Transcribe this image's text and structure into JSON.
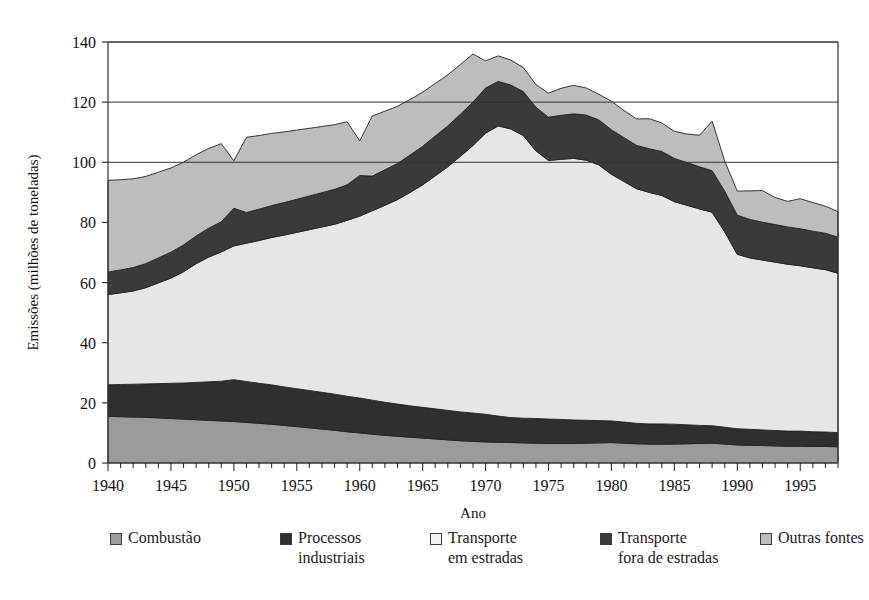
{
  "chart_data": {
    "type": "area",
    "stacked": true,
    "title": "",
    "xlabel": "Ano",
    "ylabel": "Emissões (milhões de toneladas)",
    "xlim": [
      1940,
      1998
    ],
    "ylim": [
      0,
      140
    ],
    "ytick_step": 20,
    "yticks": [
      0,
      20,
      40,
      60,
      80,
      100,
      120,
      140
    ],
    "xticks_labeled": [
      1940,
      1945,
      1950,
      1955,
      1960,
      1965,
      1970,
      1975,
      1980,
      1985,
      1990,
      1995
    ],
    "xtick_minor_step": 1,
    "grid": "horizontal-above-100-only",
    "legend_position": "bottom",
    "x": [
      1940,
      1941,
      1942,
      1943,
      1944,
      1945,
      1946,
      1947,
      1948,
      1949,
      1950,
      1951,
      1952,
      1953,
      1954,
      1955,
      1956,
      1957,
      1958,
      1959,
      1960,
      1961,
      1962,
      1963,
      1964,
      1965,
      1966,
      1967,
      1968,
      1969,
      1970,
      1971,
      1972,
      1973,
      1974,
      1975,
      1976,
      1977,
      1978,
      1979,
      1980,
      1981,
      1982,
      1983,
      1984,
      1985,
      1986,
      1987,
      1988,
      1989,
      1990,
      1991,
      1992,
      1993,
      1994,
      1995,
      1996,
      1997,
      1998
    ],
    "series": [
      {
        "name": "Combustão",
        "color": "#9b9b9b",
        "values": [
          15.5,
          15.4,
          15.3,
          15.2,
          15.0,
          14.8,
          14.6,
          14.4,
          14.2,
          14.0,
          13.8,
          13.5,
          13.2,
          12.9,
          12.5,
          12.1,
          11.7,
          11.3,
          10.9,
          10.4,
          10.0,
          9.6,
          9.2,
          8.9,
          8.6,
          8.3,
          8.0,
          7.7,
          7.4,
          7.2,
          7.0,
          6.9,
          6.8,
          6.7,
          6.6,
          6.5,
          6.5,
          6.5,
          6.6,
          6.7,
          6.8,
          6.6,
          6.4,
          6.3,
          6.3,
          6.3,
          6.4,
          6.5,
          6.6,
          6.3,
          6.0,
          5.9,
          5.8,
          5.7,
          5.6,
          5.6,
          5.5,
          5.5,
          5.4
        ]
      },
      {
        "name": "Processos industriais",
        "color": "#2f2f2f",
        "values": [
          10.5,
          10.7,
          10.9,
          11.1,
          11.4,
          11.7,
          12.0,
          12.4,
          12.8,
          13.2,
          13.9,
          13.6,
          13.3,
          13.1,
          12.8,
          12.6,
          12.4,
          12.2,
          12.0,
          11.8,
          11.6,
          11.3,
          11.0,
          10.7,
          10.4,
          10.2,
          10.0,
          9.8,
          9.6,
          9.4,
          9.2,
          8.7,
          8.3,
          8.2,
          8.2,
          8.1,
          8.0,
          7.8,
          7.6,
          7.4,
          7.2,
          7.0,
          6.8,
          6.7,
          6.7,
          6.6,
          6.3,
          6.0,
          5.8,
          5.6,
          5.4,
          5.3,
          5.2,
          5.1,
          5.0,
          5.0,
          4.9,
          4.8,
          4.7
        ]
      },
      {
        "name": "Transporte em estradas",
        "color": "#e6e6e6",
        "values": [
          30.0,
          30.5,
          31.0,
          32.0,
          33.5,
          35.0,
          37.0,
          39.5,
          41.5,
          43.0,
          44.5,
          46.0,
          47.5,
          49.0,
          50.5,
          52.0,
          53.5,
          55.0,
          56.5,
          58.5,
          60.5,
          63.0,
          65.5,
          68.0,
          71.0,
          74.0,
          77.5,
          81.0,
          85.0,
          89.0,
          93.5,
          96.5,
          96.0,
          94.0,
          89.0,
          86.0,
          86.5,
          87.0,
          86.5,
          85.0,
          82.0,
          80.0,
          78.0,
          77.0,
          76.0,
          74.0,
          73.0,
          72.0,
          71.0,
          65.0,
          58.0,
          57.0,
          56.5,
          56.0,
          55.5,
          55.0,
          54.5,
          54.0,
          53.0
        ]
      },
      {
        "name": "Transporte fora de estradas",
        "color": "#3a3a3a",
        "values": [
          7.5,
          7.6,
          7.8,
          8.0,
          8.3,
          8.6,
          8.9,
          9.2,
          9.6,
          10.0,
          12.5,
          10.2,
          10.4,
          10.6,
          10.8,
          11.0,
          11.2,
          11.4,
          11.6,
          11.8,
          13.5,
          11.5,
          11.8,
          12.0,
          12.4,
          12.8,
          13.2,
          13.6,
          14.0,
          14.4,
          15.0,
          14.8,
          14.6,
          14.6,
          14.5,
          14.4,
          14.6,
          14.8,
          15.0,
          15.0,
          14.8,
          14.6,
          14.4,
          14.5,
          14.6,
          14.4,
          14.2,
          14.0,
          13.8,
          13.5,
          13.0,
          12.8,
          12.6,
          12.5,
          12.4,
          12.3,
          12.2,
          12.1,
          12.0
        ]
      },
      {
        "name": "Outras fontes",
        "color": "#bdbdbd",
        "values": [
          30.5,
          30.0,
          29.5,
          29.0,
          28.5,
          28.0,
          27.5,
          27.0,
          26.5,
          26.0,
          15.8,
          25.0,
          24.5,
          24.0,
          23.5,
          23.0,
          22.5,
          22.0,
          21.5,
          21.0,
          11.5,
          20.0,
          19.5,
          19.0,
          18.5,
          18.0,
          17.5,
          17.0,
          16.5,
          16.0,
          9.0,
          8.5,
          8.3,
          8.0,
          7.5,
          8.0,
          9.0,
          9.5,
          9.0,
          8.5,
          9.5,
          9.0,
          8.8,
          10.0,
          9.5,
          9.0,
          9.5,
          10.5,
          16.5,
          10.0,
          8.0,
          9.5,
          10.5,
          9.0,
          8.5,
          10.0,
          9.5,
          9.0,
          8.5
        ]
      }
    ]
  },
  "legend": {
    "items": [
      {
        "label": "Combustão",
        "swatch": "#9b9b9b"
      },
      {
        "label": "Processos\nindustriais",
        "swatch": "#2f2f2f"
      },
      {
        "label": "Transporte\nem estradas",
        "swatch": "#f2f2f2"
      },
      {
        "label": "Transporte\nfora de estradas",
        "swatch": "#3a3a3a"
      },
      {
        "label": "Outras fontes",
        "swatch": "#bdbdbd"
      }
    ]
  }
}
